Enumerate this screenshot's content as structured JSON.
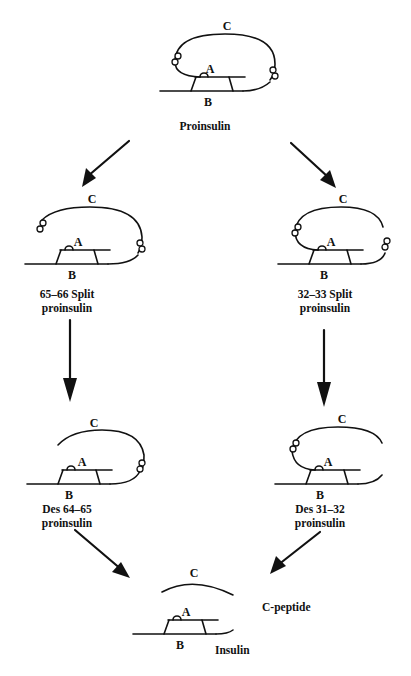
{
  "diagram": {
    "chain_labels": {
      "a": "A",
      "b": "B",
      "c": "C"
    },
    "nodes": [
      {
        "id": "proinsulin",
        "label_lines": [
          "Proinsulin"
        ],
        "cleavages": "none"
      },
      {
        "id": "split-65-66",
        "label_lines": [
          "65–66 Split",
          "proinsulin"
        ],
        "cleavages": "C-A junction cut"
      },
      {
        "id": "split-32-33",
        "label_lines": [
          "32–33 Split",
          "proinsulin"
        ],
        "cleavages": "B-C junction cut"
      },
      {
        "id": "des-64-65",
        "label_lines": [
          "Des 64–65",
          "proinsulin"
        ],
        "cleavages": "C-A junction removed"
      },
      {
        "id": "des-31-32",
        "label_lines": [
          "Des 31–32",
          "proinsulin"
        ],
        "cleavages": "B-C junction removed"
      },
      {
        "id": "insulin",
        "label_lines": [
          "Insulin"
        ],
        "cleavages": "both"
      }
    ],
    "side_products": [
      {
        "id": "c-peptide",
        "label": "C-peptide"
      }
    ],
    "edges": [
      {
        "from": "proinsulin",
        "to": "split-65-66"
      },
      {
        "from": "proinsulin",
        "to": "split-32-33"
      },
      {
        "from": "split-65-66",
        "to": "des-64-65"
      },
      {
        "from": "split-32-33",
        "to": "des-31-32"
      },
      {
        "from": "des-64-65",
        "to": "insulin"
      },
      {
        "from": "des-31-32",
        "to": "insulin"
      }
    ]
  }
}
